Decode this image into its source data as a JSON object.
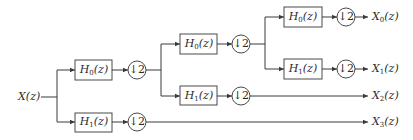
{
  "diagram": {
    "type": "wavelet-packet-filter-bank-tree",
    "input": {
      "label_main": "X",
      "label_arg": "(z)"
    },
    "filters": [
      {
        "id": "f1",
        "name": "H",
        "sub": "0",
        "arg": "(z)"
      },
      {
        "id": "f2",
        "name": "H",
        "sub": "1",
        "arg": "(z)"
      },
      {
        "id": "f3",
        "name": "H",
        "sub": "0",
        "arg": "(z)"
      },
      {
        "id": "f4",
        "name": "H",
        "sub": "1",
        "arg": "(z)"
      },
      {
        "id": "f5",
        "name": "H",
        "sub": "0",
        "arg": "(z)"
      },
      {
        "id": "f6",
        "name": "H",
        "sub": "1",
        "arg": "(z)"
      }
    ],
    "downsamplers": [
      {
        "id": "d1",
        "label": "↓2"
      },
      {
        "id": "d2",
        "label": "↓2"
      },
      {
        "id": "d3",
        "label": "↓2"
      },
      {
        "id": "d4",
        "label": "↓2"
      },
      {
        "id": "d5",
        "label": "↓2"
      },
      {
        "id": "d6",
        "label": "↓2"
      }
    ],
    "outputs": [
      {
        "id": "o0",
        "name": "X",
        "sub": "0",
        "arg": "(z)"
      },
      {
        "id": "o1",
        "name": "X",
        "sub": "1",
        "arg": "(z)"
      },
      {
        "id": "o2",
        "name": "X",
        "sub": "2",
        "arg": "(z)"
      },
      {
        "id": "o3",
        "name": "X",
        "sub": "3",
        "arg": "(z)"
      }
    ],
    "colors": {
      "line": "#3a3a3a",
      "text": "#2a2a2a",
      "background": "#ffffff"
    }
  }
}
